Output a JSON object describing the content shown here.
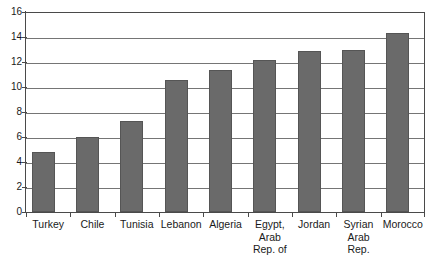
{
  "chart_data": {
    "type": "bar",
    "title": "",
    "xlabel": "",
    "ylabel": "",
    "ylim": [
      0,
      16
    ],
    "yticks": [
      0,
      2,
      4,
      6,
      8,
      10,
      12,
      14,
      16
    ],
    "grid": true,
    "legend": false,
    "orientation": "vertical",
    "bar_color": "#6a6a6a",
    "categories": [
      "Turkey",
      "Chile",
      "Tunisia",
      "Lebanon",
      "Algeria",
      "Egypt, Arab Rep. of",
      "Jordan",
      "Syrian Arab Rep.",
      "Morocco"
    ],
    "category_lines": [
      [
        "Turkey"
      ],
      [
        "Chile"
      ],
      [
        "Tunisia"
      ],
      [
        "Lebanon"
      ],
      [
        "Algeria"
      ],
      [
        "Egypt,",
        "Arab",
        "Rep. of"
      ],
      [
        "Jordan"
      ],
      [
        "Syrian",
        "Arab",
        "Rep."
      ],
      [
        "Morocco"
      ]
    ],
    "values": [
      4.8,
      6.0,
      7.3,
      10.6,
      11.4,
      12.2,
      12.9,
      13.0,
      14.3
    ]
  },
  "axis": {
    "y_tick_labels": [
      "16",
      "14",
      "12",
      "10",
      "8",
      "6",
      "4",
      "2",
      "0"
    ]
  }
}
